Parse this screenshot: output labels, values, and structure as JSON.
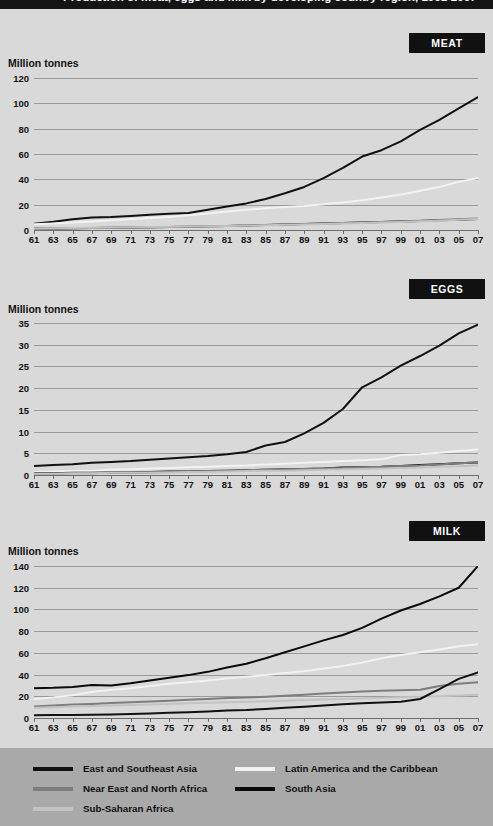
{
  "figure": {
    "title": "Production of meat, eggs and milk by developing country region, 1961-2007",
    "units_label": "Million tonnes"
  },
  "panels": [
    {
      "tag": "MEAT"
    },
    {
      "tag": "EGGS"
    },
    {
      "tag": "MILK"
    }
  ],
  "legend": {
    "items": [
      {
        "label": "East and Southeast Asia",
        "color": "#111111"
      },
      {
        "label": "Near East and North Africa",
        "color": "#7d7d7d"
      },
      {
        "label": "Sub-Saharan Africa",
        "color": "#c2c2c2"
      },
      {
        "label": "Latin America and the Caribbean",
        "color": "#f2f2f2"
      },
      {
        "label": "South Asia",
        "color": "#0b0b0b"
      }
    ]
  },
  "chart_data": [
    {
      "type": "line",
      "title": "MEAT",
      "xlabel": "",
      "ylabel": "Million tonnes",
      "ylim": [
        0,
        120
      ],
      "yticks": [
        0,
        20,
        40,
        60,
        80,
        100,
        120
      ],
      "xlim": [
        1961,
        2007
      ],
      "xticks": [
        1961,
        1963,
        1965,
        1967,
        1969,
        1971,
        1973,
        1975,
        1977,
        1979,
        1981,
        1983,
        1985,
        1987,
        1989,
        1991,
        1993,
        1995,
        1997,
        1999,
        2001,
        2003,
        2005,
        2007
      ],
      "xticklabels": [
        "61",
        "63",
        "65",
        "67",
        "69",
        "71",
        "73",
        "75",
        "77",
        "79",
        "81",
        "83",
        "85",
        "87",
        "89",
        "91",
        "93",
        "95",
        "97",
        "99",
        "01",
        "03",
        "05",
        "07"
      ],
      "grid": true,
      "legend_position": "bottom",
      "x": [
        1961,
        1963,
        1965,
        1967,
        1969,
        1971,
        1973,
        1975,
        1977,
        1979,
        1981,
        1983,
        1985,
        1987,
        1989,
        1991,
        1993,
        1995,
        1997,
        1999,
        2001,
        2003,
        2005,
        2007
      ],
      "series": [
        {
          "name": "East and Southeast Asia",
          "color": "#111111",
          "values": [
            5.0,
            6.5,
            8.5,
            9.8,
            10.2,
            11.0,
            12.0,
            12.8,
            13.5,
            16.0,
            18.5,
            21.0,
            24.5,
            29.0,
            34.0,
            41.0,
            49.0,
            58.0,
            63.0,
            70.0,
            79.0,
            87.0,
            96.0,
            105.0
          ]
        },
        {
          "name": "Latin America and the Caribbean",
          "color": "#f2f2f2",
          "values": [
            4.6,
            5.2,
            6.0,
            6.8,
            7.6,
            8.6,
            9.4,
            10.2,
            11.6,
            13.0,
            14.6,
            16.0,
            17.2,
            18.2,
            19.0,
            20.4,
            21.8,
            23.4,
            25.6,
            28.0,
            31.0,
            34.0,
            38.0,
            41.0
          ]
        },
        {
          "name": "South Asia",
          "color": "#0b0b0b",
          "values": [
            1.1,
            1.2,
            1.4,
            1.6,
            1.8,
            2.0,
            2.2,
            2.4,
            2.6,
            2.9,
            3.2,
            3.5,
            3.9,
            4.3,
            4.7,
            5.1,
            5.5,
            5.9,
            6.3,
            6.7,
            7.1,
            7.6,
            8.1,
            8.7
          ]
        },
        {
          "name": "Near East and North Africa",
          "color": "#7d7d7d",
          "values": [
            1.0,
            1.1,
            1.3,
            1.5,
            1.7,
            1.9,
            2.1,
            2.3,
            2.6,
            2.9,
            3.2,
            3.6,
            4.0,
            4.4,
            4.8,
            5.2,
            5.6,
            6.0,
            6.4,
            6.9,
            7.4,
            7.9,
            8.4,
            9.0
          ]
        },
        {
          "name": "Sub-Saharan Africa",
          "color": "#c2c2c2",
          "values": [
            1.2,
            1.3,
            1.5,
            1.7,
            1.9,
            2.1,
            2.3,
            2.5,
            2.7,
            3.0,
            3.2,
            3.5,
            3.8,
            4.1,
            4.4,
            4.8,
            5.2,
            5.6,
            6.0,
            6.4,
            6.9,
            7.4,
            8.0,
            8.6
          ]
        }
      ]
    },
    {
      "type": "line",
      "title": "EGGS",
      "xlabel": "",
      "ylabel": "Million tonnes",
      "ylim": [
        0,
        35
      ],
      "yticks": [
        0,
        5,
        10,
        15,
        20,
        25,
        30,
        35
      ],
      "xlim": [
        1961,
        2007
      ],
      "xticks": [
        1961,
        1963,
        1965,
        1967,
        1969,
        1971,
        1973,
        1975,
        1977,
        1979,
        1981,
        1983,
        1985,
        1987,
        1989,
        1991,
        1993,
        1995,
        1997,
        1999,
        2001,
        2003,
        2005,
        2007
      ],
      "xticklabels": [
        "61",
        "63",
        "65",
        "67",
        "69",
        "71",
        "73",
        "75",
        "77",
        "79",
        "81",
        "83",
        "85",
        "87",
        "89",
        "91",
        "93",
        "95",
        "97",
        "99",
        "01",
        "03",
        "05",
        "07"
      ],
      "grid": true,
      "legend_position": "bottom",
      "x": [
        1961,
        1963,
        1965,
        1967,
        1969,
        1971,
        1973,
        1975,
        1977,
        1979,
        1981,
        1983,
        1985,
        1987,
        1989,
        1991,
        1993,
        1995,
        1997,
        1999,
        2001,
        2003,
        2005,
        2007
      ],
      "series": [
        {
          "name": "East and Southeast Asia",
          "color": "#111111",
          "values": [
            2.1,
            2.3,
            2.5,
            2.8,
            3.0,
            3.2,
            3.5,
            3.8,
            4.1,
            4.4,
            4.8,
            5.3,
            6.8,
            7.6,
            9.6,
            12.0,
            15.2,
            20.2,
            22.5,
            25.2,
            27.4,
            29.8,
            32.6,
            34.6
          ]
        },
        {
          "name": "Latin America and the Caribbean",
          "color": "#f2f2f2",
          "values": [
            0.7,
            0.8,
            0.9,
            1.0,
            1.2,
            1.3,
            1.5,
            1.6,
            1.8,
            1.9,
            2.1,
            2.2,
            2.4,
            2.6,
            2.8,
            3.0,
            3.2,
            3.4,
            3.6,
            4.6,
            4.8,
            5.1,
            5.5,
            5.9
          ]
        },
        {
          "name": "South Asia",
          "color": "#0b0b0b",
          "values": [
            0.4,
            0.4,
            0.5,
            0.5,
            0.6,
            0.6,
            0.7,
            0.8,
            0.8,
            0.9,
            1.0,
            1.1,
            1.2,
            1.3,
            1.4,
            1.5,
            1.7,
            1.8,
            1.9,
            2.1,
            2.3,
            2.5,
            2.7,
            2.9
          ]
        },
        {
          "name": "Near East and North Africa",
          "color": "#7d7d7d",
          "values": [
            0.3,
            0.3,
            0.4,
            0.4,
            0.5,
            0.5,
            0.6,
            0.7,
            0.8,
            0.9,
            1.0,
            1.1,
            1.2,
            1.3,
            1.4,
            1.5,
            1.6,
            1.8,
            1.9,
            2.1,
            2.2,
            2.4,
            2.7,
            2.9
          ]
        },
        {
          "name": "Sub-Saharan Africa",
          "color": "#c2c2c2",
          "values": [
            0.3,
            0.3,
            0.4,
            0.4,
            0.5,
            0.5,
            0.6,
            0.6,
            0.7,
            0.7,
            0.8,
            0.9,
            1.0,
            1.0,
            1.1,
            1.2,
            1.3,
            1.4,
            1.5,
            1.6,
            1.7,
            1.9,
            2.0,
            2.2
          ]
        }
      ]
    },
    {
      "type": "line",
      "title": "MILK",
      "xlabel": "",
      "ylabel": "Million tonnes",
      "ylim": [
        0,
        140
      ],
      "yticks": [
        0,
        20,
        40,
        60,
        80,
        100,
        120,
        140
      ],
      "xlim": [
        1961,
        2007
      ],
      "xticks": [
        1961,
        1963,
        1965,
        1967,
        1969,
        1971,
        1973,
        1975,
        1977,
        1979,
        1981,
        1983,
        1985,
        1987,
        1989,
        1991,
        1993,
        1995,
        1997,
        1999,
        2001,
        2003,
        2005,
        2007
      ],
      "xticklabels": [
        "61",
        "63",
        "65",
        "67",
        "69",
        "71",
        "73",
        "75",
        "77",
        "79",
        "81",
        "83",
        "85",
        "87",
        "89",
        "91",
        "93",
        "95",
        "97",
        "99",
        "01",
        "03",
        "05",
        "07"
      ],
      "grid": true,
      "legend_position": "bottom",
      "x": [
        1961,
        1963,
        1965,
        1967,
        1969,
        1971,
        1973,
        1975,
        1977,
        1979,
        1981,
        1983,
        1985,
        1987,
        1989,
        1991,
        1993,
        1995,
        1997,
        1999,
        2001,
        2003,
        2005,
        2007
      ],
      "series": [
        {
          "name": "South Asia",
          "color": "#0b0b0b",
          "values": [
            27.5,
            27.8,
            28.5,
            30.5,
            30.0,
            32.0,
            34.5,
            37.0,
            39.5,
            42.5,
            46.5,
            50.0,
            55.0,
            60.5,
            66.0,
            71.5,
            76.5,
            83.0,
            91.5,
            99.0,
            105.0,
            112.0,
            120.0,
            140.0
          ]
        },
        {
          "name": "Latin America and the Caribbean",
          "color": "#f2f2f2",
          "values": [
            17.5,
            19.0,
            21.0,
            24.0,
            26.0,
            27.5,
            29.5,
            31.5,
            33.0,
            34.5,
            36.5,
            38.0,
            39.5,
            41.5,
            43.0,
            45.5,
            48.0,
            51.0,
            55.0,
            58.0,
            60.5,
            63.0,
            66.0,
            68.0
          ]
        },
        {
          "name": "Near East and North Africa",
          "color": "#7d7d7d",
          "values": [
            10.5,
            11.5,
            12.5,
            13.0,
            13.8,
            14.5,
            15.2,
            16.0,
            16.8,
            17.5,
            18.5,
            18.8,
            19.5,
            20.5,
            21.5,
            22.5,
            23.5,
            24.5,
            25.0,
            25.5,
            26.0,
            29.5,
            31.5,
            33.0
          ]
        },
        {
          "name": "Sub-Saharan Africa",
          "color": "#c2c2c2",
          "values": [
            9.5,
            10.0,
            10.5,
            11.0,
            11.5,
            12.0,
            12.5,
            13.0,
            13.5,
            14.0,
            14.5,
            15.0,
            15.5,
            16.0,
            16.5,
            17.0,
            17.5,
            18.0,
            18.5,
            19.0,
            19.5,
            20.0,
            20.8,
            21.5
          ]
        },
        {
          "name": "East and Southeast Asia",
          "color": "#111111",
          "values": [
            2.6,
            2.7,
            2.8,
            3.0,
            3.2,
            3.6,
            4.2,
            4.8,
            5.4,
            6.0,
            6.8,
            7.4,
            8.4,
            9.4,
            10.4,
            11.5,
            12.6,
            13.6,
            14.2,
            15.0,
            17.5,
            26.5,
            36.0,
            42.0
          ]
        }
      ]
    }
  ]
}
